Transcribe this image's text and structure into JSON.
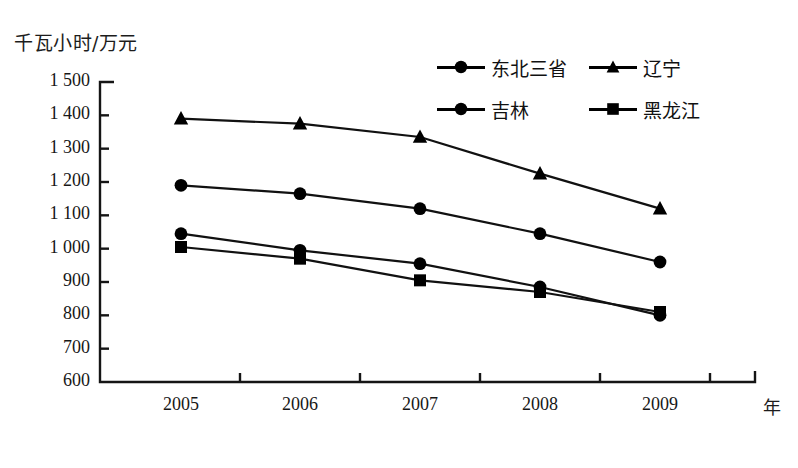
{
  "chart_data": {
    "type": "line",
    "title": "",
    "ylabel": "千瓦小时/万元",
    "xlabel": "年",
    "categories": [
      "2005",
      "2006",
      "2007",
      "2008",
      "2009"
    ],
    "x": [
      2005,
      2006,
      2007,
      2008,
      2009
    ],
    "ylim": [
      600,
      1500
    ],
    "yticks": [
      "1 500",
      "1 400",
      "1 300",
      "1 200",
      "1 100",
      "1 000",
      "900",
      "800",
      "700",
      "600"
    ],
    "ytick_values": [
      1500,
      1400,
      1300,
      1200,
      1100,
      1000,
      900,
      800,
      700,
      600
    ],
    "grid": false,
    "legend_position": "top-right",
    "series": [
      {
        "name": "东北三省",
        "marker": "circle",
        "values": [
          1045,
          995,
          955,
          885,
          800
        ]
      },
      {
        "name": "辽宁",
        "marker": "triangle",
        "values": [
          1390,
          1375,
          1335,
          1225,
          1120
        ]
      },
      {
        "name": "吉林",
        "marker": "circle",
        "values": [
          1190,
          1165,
          1120,
          1045,
          960
        ]
      },
      {
        "name": "黑龙江",
        "marker": "square",
        "values": [
          1005,
          970,
          905,
          870,
          810
        ]
      }
    ]
  },
  "legend": {
    "items": [
      {
        "label": "东北三省",
        "marker": "circle-marker"
      },
      {
        "label": "辽宁",
        "marker": "triangle-marker"
      },
      {
        "label": "吉林",
        "marker": "circle-marker"
      },
      {
        "label": "黑龙江",
        "marker": "square-marker"
      }
    ]
  },
  "colors": {
    "line": "#111111",
    "axis": "#151515",
    "text": "#171717",
    "background": "#ffffff"
  }
}
